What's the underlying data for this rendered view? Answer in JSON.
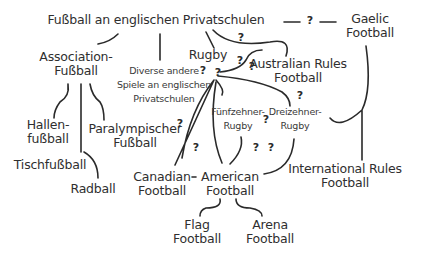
{
  "nodes": {
    "root": "Fußball an englischen Privatschulen",
    "association": [
      "Association-",
      "Fußball"
    ],
    "diverse": [
      "Diverse andere",
      "Spiele an englischen",
      "Privatschulen"
    ],
    "rugby": "Rugby",
    "australian": [
      "Australian Rules",
      "Football"
    ],
    "gaelic": [
      "Gaelic",
      "Football"
    ],
    "hallen": [
      "Hallen-",
      "fußball"
    ],
    "tisch": "Tischfußball",
    "radball": "Radball",
    "paralympic": [
      "Paralympischer",
      "Fußball"
    ],
    "fuenfzehner": [
      "Fünfzehner-",
      "Rugby"
    ],
    "dreizehner": [
      "Dreizehner-",
      "Rugby"
    ],
    "international": [
      "International Rules",
      "Football"
    ],
    "canadian": [
      "Canadian",
      "Football"
    ],
    "american": [
      "American",
      "Football"
    ],
    "flag": [
      "Flag",
      "Football"
    ],
    "arena": [
      "Arena",
      "Football"
    ]
  },
  "uncertain_marker": "?"
}
